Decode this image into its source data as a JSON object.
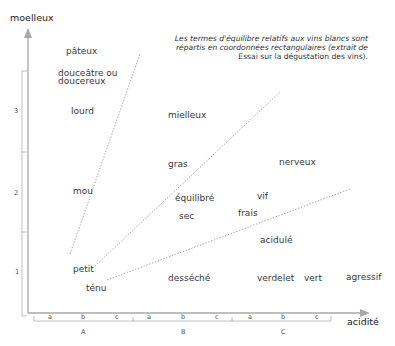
{
  "axes": {
    "y_label": "moelleux",
    "x_label": "acidité",
    "y_ticks": [
      "3",
      "2",
      "1"
    ],
    "x_sub_ticks": [
      "a",
      "b",
      "c",
      "a",
      "b",
      "c",
      "a",
      "b",
      "c"
    ],
    "x_groups": [
      "A",
      "B",
      "C"
    ]
  },
  "caption": {
    "line1": "Les termes d'équilibre relatifs aux vins blancs sont",
    "line2": "répartis en coordonnées rectangulaires (extrait de",
    "line3": "Essai sur la dégustation des vins)."
  },
  "terms": {
    "pateux": "pâteux",
    "douceatre_1": "douceâtre ou",
    "douceatre_2": "doucereux",
    "lourd": "lourd",
    "mielleux": "mielleux",
    "gras": "gras",
    "nerveux": "nerveux",
    "mou": "mou",
    "equilibre": "équilibré",
    "vif": "vif",
    "sec": "sec",
    "frais": "frais",
    "acidule": "acidulé",
    "petit": "petit",
    "tenu": "ténu",
    "desseche": "desséché",
    "verdelet": "verdelet",
    "vert": "vert",
    "agressif": "agressif"
  },
  "colors": {
    "axis": "#a0a0a0",
    "dotted": "#9a9a9a",
    "text": "#3a3a3a"
  }
}
